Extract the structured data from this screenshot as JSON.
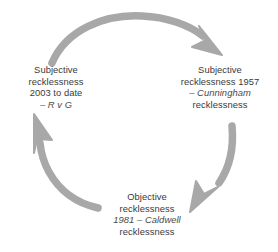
{
  "diagram": {
    "type": "cycle",
    "background_color": "#ffffff",
    "arrow_color": "#a8a8a8",
    "text_color": "#3a3a3a",
    "italic_text_color": "#4a4a4a",
    "nodes": [
      {
        "id": "cunningham",
        "position": "right",
        "lines": [
          {
            "text": "Subjective",
            "style": "normal"
          },
          {
            "text": "recklessness 1957",
            "style": "normal"
          },
          {
            "text": "– Cunningham",
            "style": "italic"
          },
          {
            "text": "recklessness",
            "style": "normal"
          }
        ]
      },
      {
        "id": "caldwell",
        "position": "bottom",
        "lines": [
          {
            "text": "Objective",
            "style": "normal"
          },
          {
            "text": "recklessness",
            "style": "normal"
          },
          {
            "text": "1981 – Caldwell",
            "style": "italic"
          },
          {
            "text": "recklessness",
            "style": "normal"
          }
        ]
      },
      {
        "id": "rvg",
        "position": "left",
        "lines": [
          {
            "text": "Subjective",
            "style": "normal"
          },
          {
            "text": "recklessness",
            "style": "normal"
          },
          {
            "text": "2003 to date",
            "style": "normal"
          },
          {
            "text": "– R v G",
            "style": "italic"
          }
        ]
      }
    ],
    "arrows": [
      {
        "id": "arrow-top",
        "from": "rvg",
        "to": "cunningham",
        "direction": "clockwise-top"
      },
      {
        "id": "arrow-right",
        "from": "cunningham",
        "to": "caldwell",
        "direction": "clockwise-right"
      },
      {
        "id": "arrow-left",
        "from": "caldwell",
        "to": "rvg",
        "direction": "clockwise-left"
      }
    ]
  }
}
